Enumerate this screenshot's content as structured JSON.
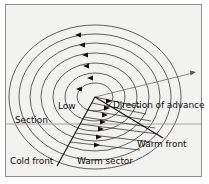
{
  "figure": {
    "background_color": "#f2f2f0",
    "frame_color": "#8d8d8d",
    "line_color": "#3a3a3a",
    "text_color": "#15100d"
  },
  "labels": {
    "low": "Low",
    "section": "Section",
    "direction_of_advance": "Direction of advance",
    "warm_front": "Warm front",
    "cold_front": "Cold front",
    "warm_sector": "Warm sector"
  },
  "diagram": {
    "center": {
      "x": 95,
      "y": 97
    },
    "isobar_count": 7,
    "isobars": [
      {
        "rx": 18,
        "ry": 14
      },
      {
        "rx": 30,
        "ry": 24
      },
      {
        "rx": 42,
        "ry": 34
      },
      {
        "rx": 54,
        "ry": 44
      },
      {
        "rx": 65,
        "ry": 54
      },
      {
        "rx": 76,
        "ry": 63
      },
      {
        "rx": 86,
        "ry": 72
      }
    ],
    "cold_air_arrows": 6,
    "cold_air_arrow_direction": "left",
    "warm_sector_lines": 7,
    "warm_sector_arrow_direction": "right",
    "cold_front_line": {
      "x1": 95,
      "y1": 97,
      "x2": 57,
      "y2": 165
    },
    "warm_front_line": {
      "x1": 95,
      "y1": 97,
      "x2": 162,
      "y2": 137
    },
    "section_line": {
      "x1": 6,
      "y1": 124,
      "x2": 201,
      "y2": 124
    },
    "direction_arrow": {
      "x1": 95,
      "y1": 97,
      "x2": 196,
      "y2": 72
    }
  }
}
